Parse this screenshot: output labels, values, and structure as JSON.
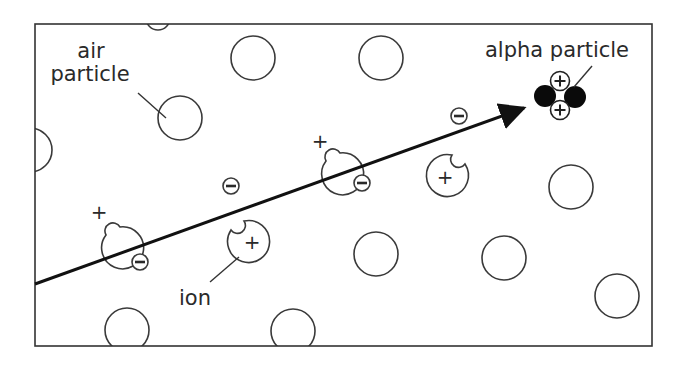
{
  "diagram": {
    "labels": {
      "air_particle_line1": "air",
      "air_particle_line2": "particle",
      "alpha_particle": "alpha particle",
      "ion": "ion"
    },
    "symbols": {
      "positive": "+",
      "negative": "−"
    },
    "colors": {
      "line": "#2a2a2a",
      "background": "#ffffff",
      "alpha_nucleon": "#0a0a0a"
    },
    "counts": {
      "air_particles": 11,
      "ions": 4,
      "free_electrons": 4
    }
  }
}
